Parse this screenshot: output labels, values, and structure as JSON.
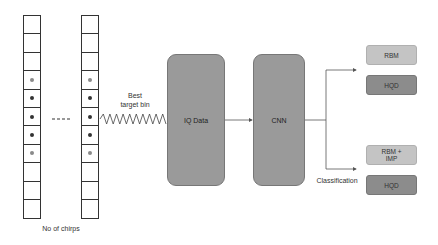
{
  "diagram": {
    "columns": [
      {
        "id": "first",
        "cells": [
          "empty",
          "empty",
          "empty",
          "light",
          "dark",
          "dark",
          "dark",
          "light",
          "empty",
          "empty",
          "empty"
        ]
      },
      {
        "id": "last",
        "cells": [
          "empty",
          "empty",
          "empty",
          "light",
          "dark",
          "dark",
          "dark",
          "light",
          "empty",
          "empty",
          "empty"
        ]
      }
    ],
    "ellipsis": "- - -",
    "chirps_label": "No of chirps",
    "target_bin_label_line1": "Best",
    "target_bin_label_line2": "target bin",
    "iq_box_label": "IQ Data",
    "cnn_box_label": "CNN",
    "classification_label": "Classification",
    "outputs": [
      {
        "label": "RBM",
        "shade": "light"
      },
      {
        "label": "HQD",
        "shade": "dark"
      },
      {
        "label": "RBM +\nIMP",
        "shade": "light"
      },
      {
        "label": "HQD",
        "shade": "dark"
      }
    ],
    "colors": {
      "block": "#9a9a9a",
      "light_box": "#c4c4c4",
      "dark_box": "#8c8c8c",
      "line": "#555555"
    }
  }
}
